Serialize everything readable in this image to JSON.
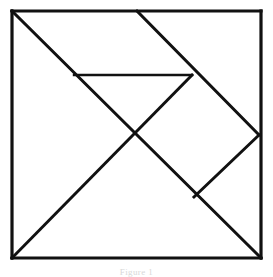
{
  "figure": {
    "caption": "Figure 1",
    "background_color": "#ffffff",
    "line_color": "#111111",
    "canvas": {
      "width": 273,
      "height": 276
    }
  },
  "chart_data": {
    "type": "diagram",
    "xlabel": "",
    "ylabel": "",
    "xlim": [
      0,
      273
    ],
    "ylim": [
      0,
      276
    ],
    "grid": false,
    "legend": "none",
    "square": {
      "label": "outer square",
      "top_left": [
        12,
        11
      ],
      "top_right": [
        261,
        11
      ],
      "bottom_right": [
        261,
        258
      ],
      "bottom_left": [
        12,
        258
      ],
      "width": 249,
      "height": 247
    },
    "key_points": {
      "A_top_left": [
        12,
        11
      ],
      "B_top_mid": [
        137,
        11
      ],
      "C_top_right": [
        261,
        11
      ],
      "D_right_mid": [
        259,
        135
      ],
      "E_bottom_right": [
        261,
        258
      ],
      "F_bottom_left": [
        12,
        258
      ],
      "G_center": [
        135,
        135
      ],
      "H_horiz_left": [
        74,
        75
      ],
      "I_horiz_right": [
        192,
        75
      ],
      "J_lower_vertex": [
        194,
        197
      ]
    },
    "segments": [
      {
        "name": "outer-top",
        "kind": "outer-edge",
        "from": [
          12,
          11
        ],
        "to": [
          261,
          11
        ]
      },
      {
        "name": "outer-right",
        "kind": "outer-edge",
        "from": [
          261,
          11
        ],
        "to": [
          261,
          258
        ]
      },
      {
        "name": "outer-bottom",
        "kind": "outer-edge",
        "from": [
          261,
          258
        ],
        "to": [
          12,
          258
        ]
      },
      {
        "name": "outer-left",
        "kind": "outer-edge",
        "from": [
          12,
          258
        ],
        "to": [
          12,
          11
        ]
      },
      {
        "name": "main-diagonal-tl-br",
        "kind": "inner-cut",
        "from": [
          12,
          11
        ],
        "to": [
          261,
          258
        ]
      },
      {
        "name": "diagonal-bl-to-horiz-right",
        "kind": "inner-cut",
        "from": [
          12,
          258
        ],
        "to": [
          192,
          75
        ]
      },
      {
        "name": "diagonal-topmid-to-rightmid",
        "kind": "inner-cut",
        "from": [
          137,
          11
        ],
        "to": [
          259,
          135
        ]
      },
      {
        "name": "horizontal-cut",
        "kind": "thin-cut",
        "from": [
          74,
          75
        ],
        "to": [
          192,
          75
        ]
      },
      {
        "name": "diagonal-rightmid-to-lower-vertex",
        "kind": "inner-cut",
        "from": [
          259,
          135
        ],
        "to": [
          194,
          197
        ]
      }
    ],
    "pieces": [
      {
        "name": "large-triangle-lower-left",
        "vertices": [
          [
            12,
            11
          ],
          [
            12,
            258
          ],
          [
            135,
            135
          ]
        ]
      },
      {
        "name": "large-triangle-bottom",
        "vertices": [
          [
            12,
            258
          ],
          [
            261,
            258
          ],
          [
            135,
            135
          ]
        ]
      },
      {
        "name": "medium-triangle-top",
        "vertices": [
          [
            74,
            75
          ],
          [
            192,
            75
          ],
          [
            135,
            135
          ]
        ]
      },
      {
        "name": "small-triangle-top-right",
        "vertices": [
          [
            137,
            11
          ],
          [
            192,
            75
          ],
          [
            74,
            75
          ]
        ]
      },
      {
        "name": "small-triangle-right",
        "vertices": [
          [
            259,
            135
          ],
          [
            194,
            197
          ],
          [
            228,
            166
          ]
        ]
      },
      {
        "name": "square-piece",
        "vertices": [
          [
            192,
            75
          ],
          [
            259,
            135
          ],
          [
            194,
            197
          ],
          [
            135,
            135
          ]
        ]
      },
      {
        "name": "parallelogram-piece",
        "vertices": [
          [
            137,
            11
          ],
          [
            261,
            11
          ],
          [
            261,
            135
          ],
          [
            192,
            75
          ]
        ]
      }
    ]
  }
}
